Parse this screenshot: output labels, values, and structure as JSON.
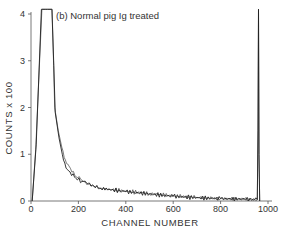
{
  "chart_data": {
    "type": "line",
    "title": "(b) Normal pig Ig treated",
    "xlabel": "CHANNEL NUMBER",
    "ylabel": "COUNTS x 100",
    "xlim": [
      0,
      1000
    ],
    "ylim": [
      0,
      4
    ],
    "x_ticks": [
      0,
      200,
      400,
      600,
      800,
      1000
    ],
    "y_ticks": [
      0,
      1,
      2,
      3,
      4
    ],
    "x_tick_labels": [
      "0",
      "200",
      "400",
      "600",
      "800",
      "1000"
    ],
    "y_tick_labels": [
      "0",
      "1",
      "2",
      "3",
      "4"
    ],
    "grid": false,
    "legend": null,
    "series": [
      {
        "name": "trace A",
        "x": [
          5,
          20,
          46,
          50,
          60,
          70,
          80,
          89,
          95,
          100,
          115,
          130,
          145,
          160,
          185,
          210,
          230,
          260,
          290,
          330,
          400,
          500,
          600,
          700,
          800,
          900,
          955,
          958,
          960,
          962,
          965
        ],
        "y": [
          0.0,
          1.1,
          4.1,
          4.1,
          4.1,
          4.1,
          4.1,
          4.1,
          3.0,
          2.0,
          1.5,
          1.15,
          0.88,
          0.75,
          0.55,
          0.46,
          0.4,
          0.33,
          0.28,
          0.25,
          0.21,
          0.16,
          0.11,
          0.08,
          0.05,
          0.04,
          0.03,
          1.5,
          4.1,
          1.0,
          0.0
        ]
      },
      {
        "name": "trace B",
        "x": [
          5,
          22,
          44,
          50,
          60,
          70,
          80,
          88,
          96,
          102,
          118,
          132,
          148,
          165,
          190,
          215,
          235,
          265,
          295,
          340,
          400,
          500,
          600,
          700,
          800,
          900,
          955,
          958,
          960,
          962,
          965
        ],
        "y": [
          0.0,
          1.2,
          4.1,
          4.1,
          4.1,
          4.1,
          4.1,
          4.1,
          2.9,
          1.9,
          1.35,
          1.0,
          0.7,
          0.62,
          0.48,
          0.42,
          0.38,
          0.32,
          0.27,
          0.24,
          0.2,
          0.15,
          0.1,
          0.07,
          0.05,
          0.04,
          0.03,
          1.5,
          4.1,
          1.0,
          0.0
        ]
      }
    ],
    "annotations": [
      "(b) Normal pig Ig treated"
    ]
  },
  "plot": {
    "x0_px": 31,
    "x1000_px": 268,
    "y0_px": 201,
    "y4_px": 14
  }
}
